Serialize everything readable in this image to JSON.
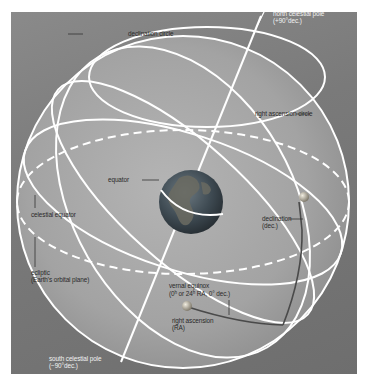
{
  "diagram": {
    "colors": {
      "background": "#767676",
      "sphere_fill": "#a9a9a9",
      "lines": "#ffffff",
      "leader_lines": "#333333",
      "ra_dec_path": "#4a4a4a",
      "earth_ocean": "#3b4a55",
      "earth_land": "#6b6b60"
    },
    "labels": {
      "north_pole": "north celestial pole",
      "north_pole_dec": "(+90°dec.)",
      "declination_circle": "declination circle",
      "right_ascension_circle": "right ascension circle",
      "equator": "equator",
      "celestial_equator": "celestial equator",
      "declination": "declination",
      "declination_abbr": "(dec.)",
      "ecliptic": "ecliptic",
      "ecliptic_note": "(Earth's orbital plane)",
      "vernal_equinox": "vernal equinox",
      "vernal_equinox_coords_a": "(0",
      "vernal_equinox_h1": "h",
      "vernal_equinox_coords_b": " or 24",
      "vernal_equinox_h2": "h",
      "vernal_equinox_coords_c": " RA, 0° dec.)",
      "right_ascension": "right ascension",
      "right_ascension_abbr": "(RA)",
      "south_pole": "south celestial pole",
      "south_pole_dec": "(−90°dec.)"
    }
  }
}
